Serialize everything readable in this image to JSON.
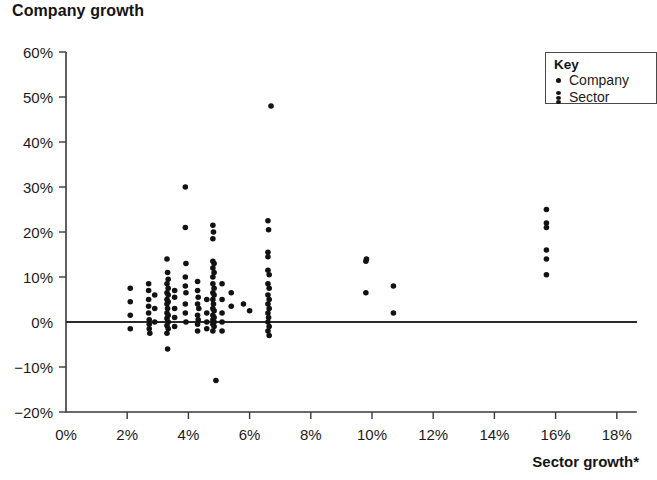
{
  "chart_data": {
    "type": "scatter",
    "title": "Company growth",
    "ylabel": "Company growth",
    "xlabel": "Sector growth*",
    "xlim": [
      0,
      18
    ],
    "ylim": [
      -20,
      60
    ],
    "x_tick_labels": [
      "0%",
      "2%",
      "4%",
      "6%",
      "8%",
      "10%",
      "12%",
      "14%",
      "16%",
      "18%"
    ],
    "x_tick_values": [
      0,
      2,
      4,
      6,
      8,
      10,
      12,
      14,
      16,
      18
    ],
    "y_tick_labels": [
      "60%",
      "50%",
      "40%",
      "30%",
      "20%",
      "10%",
      "0%",
      "−10%",
      "−20%"
    ],
    "y_tick_values": [
      60,
      50,
      40,
      30,
      20,
      10,
      0,
      -10,
      -20
    ],
    "grid": false,
    "zero_line": true,
    "legend": {
      "position": "top-right",
      "title": "Key",
      "entries": [
        {
          "label": "Company",
          "marker": "dot"
        },
        {
          "label": "Sector",
          "marker": "dot-stack"
        }
      ]
    },
    "marker_color": "#121212",
    "series": [
      {
        "name": "Company",
        "points": [
          [
            2.1,
            7.5
          ],
          [
            2.1,
            4.5
          ],
          [
            2.1,
            1.5
          ],
          [
            2.1,
            -1.5
          ],
          [
            2.7,
            8.5
          ],
          [
            2.7,
            7.0
          ],
          [
            2.7,
            5.0
          ],
          [
            2.7,
            3.5
          ],
          [
            2.7,
            2.0
          ],
          [
            2.72,
            0.5
          ],
          [
            2.72,
            -0.5
          ],
          [
            2.72,
            -1.5
          ],
          [
            2.74,
            -2.5
          ],
          [
            2.9,
            6.0
          ],
          [
            2.9,
            3.0
          ],
          [
            2.9,
            0.0
          ],
          [
            3.3,
            14.0
          ],
          [
            3.32,
            11.0
          ],
          [
            3.34,
            9.5
          ],
          [
            3.3,
            8.5
          ],
          [
            3.34,
            7.5
          ],
          [
            3.3,
            6.5
          ],
          [
            3.34,
            6.0
          ],
          [
            3.3,
            5.0
          ],
          [
            3.34,
            4.5
          ],
          [
            3.3,
            4.0
          ],
          [
            3.32,
            3.0
          ],
          [
            3.3,
            2.0
          ],
          [
            3.34,
            1.5
          ],
          [
            3.3,
            0.8
          ],
          [
            3.34,
            0.0
          ],
          [
            3.3,
            -0.8
          ],
          [
            3.34,
            -1.5
          ],
          [
            3.3,
            -2.5
          ],
          [
            3.32,
            -6.0
          ],
          [
            3.55,
            7.0
          ],
          [
            3.55,
            5.5
          ],
          [
            3.55,
            3.0
          ],
          [
            3.55,
            1.0
          ],
          [
            3.55,
            -1.0
          ],
          [
            3.9,
            30.0
          ],
          [
            3.9,
            21.0
          ],
          [
            3.92,
            13.0
          ],
          [
            3.9,
            10.0
          ],
          [
            3.9,
            8.0
          ],
          [
            3.92,
            6.5
          ],
          [
            3.9,
            4.0
          ],
          [
            3.9,
            2.0
          ],
          [
            3.92,
            0.0
          ],
          [
            4.3,
            9.0
          ],
          [
            4.3,
            7.0
          ],
          [
            4.32,
            5.5
          ],
          [
            4.3,
            4.0
          ],
          [
            4.34,
            3.0
          ],
          [
            4.3,
            1.5
          ],
          [
            4.32,
            0.5
          ],
          [
            4.3,
            -0.5
          ],
          [
            4.3,
            -2.0
          ],
          [
            4.6,
            5.0
          ],
          [
            4.6,
            2.0
          ],
          [
            4.6,
            0.0
          ],
          [
            4.6,
            -1.5
          ],
          [
            4.8,
            21.5
          ],
          [
            4.82,
            20.0
          ],
          [
            4.8,
            18.5
          ],
          [
            4.8,
            13.5
          ],
          [
            4.84,
            13.0
          ],
          [
            4.8,
            12.0
          ],
          [
            4.84,
            11.0
          ],
          [
            4.8,
            10.0
          ],
          [
            4.8,
            8.5
          ],
          [
            4.84,
            7.5
          ],
          [
            4.8,
            6.5
          ],
          [
            4.84,
            6.0
          ],
          [
            4.8,
            5.0
          ],
          [
            4.82,
            4.0
          ],
          [
            4.8,
            3.0
          ],
          [
            4.84,
            2.5
          ],
          [
            4.8,
            1.5
          ],
          [
            4.84,
            1.0
          ],
          [
            4.8,
            0.5
          ],
          [
            4.84,
            0.0
          ],
          [
            4.8,
            -0.5
          ],
          [
            4.84,
            -1.0
          ],
          [
            4.8,
            -2.0
          ],
          [
            4.9,
            -13.0
          ],
          [
            5.1,
            8.5
          ],
          [
            5.1,
            5.0
          ],
          [
            5.1,
            2.0
          ],
          [
            5.1,
            0.0
          ],
          [
            5.1,
            -2.0
          ],
          [
            5.4,
            6.5
          ],
          [
            5.4,
            3.5
          ],
          [
            5.8,
            4.0
          ],
          [
            6.0,
            2.5
          ],
          [
            6.6,
            22.5
          ],
          [
            6.62,
            20.5
          ],
          [
            6.6,
            15.5
          ],
          [
            6.6,
            14.5
          ],
          [
            6.6,
            11.5
          ],
          [
            6.64,
            10.5
          ],
          [
            6.6,
            8.5
          ],
          [
            6.64,
            7.5
          ],
          [
            6.6,
            6.0
          ],
          [
            6.64,
            5.0
          ],
          [
            6.6,
            4.0
          ],
          [
            6.64,
            3.0
          ],
          [
            6.6,
            2.0
          ],
          [
            6.62,
            1.0
          ],
          [
            6.6,
            0.0
          ],
          [
            6.64,
            -1.0
          ],
          [
            6.6,
            -2.0
          ],
          [
            6.64,
            -3.0
          ],
          [
            6.7,
            48.0
          ],
          [
            9.8,
            13.5
          ],
          [
            9.82,
            14.0
          ],
          [
            9.8,
            6.5
          ],
          [
            10.7,
            8.0
          ],
          [
            10.7,
            2.0
          ],
          [
            15.7,
            25.0
          ],
          [
            15.7,
            22.0
          ],
          [
            15.7,
            21.0
          ],
          [
            15.7,
            16.0
          ],
          [
            15.7,
            14.0
          ],
          [
            15.7,
            10.5
          ]
        ]
      }
    ]
  }
}
